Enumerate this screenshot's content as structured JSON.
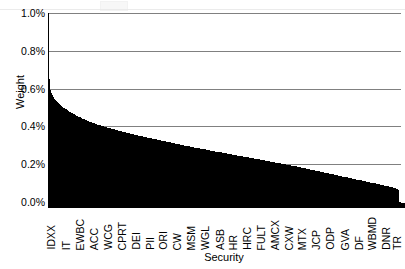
{
  "chart_data": {
    "type": "bar",
    "title": "",
    "xlabel": "Security",
    "ylabel": "Weight",
    "ylim": [
      0,
      1.0
    ],
    "y_unit": "%",
    "y_ticks": [
      "0.0%",
      "0.2%",
      "0.4%",
      "0.6%",
      "0.8%",
      "1.0%"
    ],
    "y_tick_values": [
      0.0,
      0.2,
      0.4,
      0.6,
      0.8,
      1.0
    ],
    "grid": true,
    "legend": "none",
    "bar_color": "#000000",
    "gridline_color": "#808080",
    "axis_color": "#000000",
    "n_bars": 400,
    "x_tick_labels": [
      "IDXX",
      "IT",
      "EWBC",
      "ACC",
      "WCG",
      "CPRT",
      "DEI",
      "PII",
      "ORI",
      "CW",
      "MSM",
      "WGL",
      "ASB",
      "HR",
      "HRC",
      "FULT",
      "AMCX",
      "CXW",
      "MTX",
      "JCP",
      "ODP",
      "GVA",
      "DF",
      "WBMD",
      "DNR",
      "TR"
    ],
    "x_tick_label_indices": [
      4,
      20,
      36,
      52,
      68,
      84,
      100,
      116,
      131,
      147,
      163,
      179,
      195,
      210,
      226,
      242,
      258,
      274,
      289,
      305,
      321,
      337,
      353,
      368,
      384,
      397
    ],
    "values": [
      0.652,
      0.593,
      0.575,
      0.566,
      0.558,
      0.551,
      0.545,
      0.539,
      0.534,
      0.529,
      0.524,
      0.52,
      0.515,
      0.511,
      0.507,
      0.504,
      0.5,
      0.497,
      0.493,
      0.49,
      0.487,
      0.484,
      0.481,
      0.478,
      0.475,
      0.472,
      0.47,
      0.467,
      0.464,
      0.462,
      0.459,
      0.457,
      0.455,
      0.452,
      0.45,
      0.448,
      0.446,
      0.443,
      0.441,
      0.439,
      0.437,
      0.435,
      0.433,
      0.431,
      0.429,
      0.428,
      0.426,
      0.424,
      0.422,
      0.42,
      0.419,
      0.417,
      0.415,
      0.414,
      0.412,
      0.41,
      0.409,
      0.407,
      0.406,
      0.404,
      0.403,
      0.401,
      0.4,
      0.398,
      0.397,
      0.396,
      0.394,
      0.393,
      0.391,
      0.39,
      0.389,
      0.387,
      0.386,
      0.385,
      0.384,
      0.382,
      0.381,
      0.38,
      0.379,
      0.377,
      0.376,
      0.375,
      0.374,
      0.373,
      0.371,
      0.37,
      0.369,
      0.368,
      0.367,
      0.366,
      0.364,
      0.363,
      0.362,
      0.361,
      0.36,
      0.359,
      0.358,
      0.357,
      0.356,
      0.354,
      0.353,
      0.352,
      0.351,
      0.35,
      0.349,
      0.348,
      0.347,
      0.346,
      0.345,
      0.344,
      0.343,
      0.342,
      0.341,
      0.34,
      0.339,
      0.338,
      0.337,
      0.336,
      0.335,
      0.334,
      0.333,
      0.332,
      0.331,
      0.33,
      0.329,
      0.328,
      0.327,
      0.326,
      0.325,
      0.324,
      0.323,
      0.322,
      0.321,
      0.32,
      0.319,
      0.318,
      0.317,
      0.316,
      0.315,
      0.314,
      0.313,
      0.312,
      0.311,
      0.31,
      0.309,
      0.308,
      0.307,
      0.306,
      0.305,
      0.304,
      0.303,
      0.302,
      0.301,
      0.3,
      0.299,
      0.298,
      0.298,
      0.297,
      0.296,
      0.295,
      0.294,
      0.293,
      0.292,
      0.291,
      0.29,
      0.289,
      0.288,
      0.287,
      0.287,
      0.286,
      0.285,
      0.284,
      0.283,
      0.282,
      0.281,
      0.28,
      0.279,
      0.279,
      0.278,
      0.277,
      0.276,
      0.275,
      0.274,
      0.273,
      0.272,
      0.272,
      0.271,
      0.27,
      0.269,
      0.268,
      0.267,
      0.266,
      0.266,
      0.265,
      0.264,
      0.263,
      0.262,
      0.261,
      0.26,
      0.26,
      0.259,
      0.258,
      0.257,
      0.256,
      0.255,
      0.254,
      0.254,
      0.253,
      0.252,
      0.251,
      0.25,
      0.249,
      0.248,
      0.248,
      0.247,
      0.246,
      0.245,
      0.244,
      0.243,
      0.243,
      0.242,
      0.241,
      0.24,
      0.239,
      0.238,
      0.237,
      0.237,
      0.236,
      0.235,
      0.234,
      0.233,
      0.232,
      0.232,
      0.231,
      0.23,
      0.229,
      0.228,
      0.227,
      0.226,
      0.226,
      0.225,
      0.224,
      0.223,
      0.222,
      0.221,
      0.22,
      0.22,
      0.219,
      0.218,
      0.217,
      0.216,
      0.215,
      0.214,
      0.214,
      0.213,
      0.212,
      0.211,
      0.21,
      0.209,
      0.208,
      0.207,
      0.207,
      0.206,
      0.205,
      0.204,
      0.203,
      0.202,
      0.201,
      0.2,
      0.199,
      0.199,
      0.198,
      0.197,
      0.196,
      0.195,
      0.194,
      0.193,
      0.192,
      0.191,
      0.19,
      0.189,
      0.188,
      0.188,
      0.187,
      0.186,
      0.185,
      0.184,
      0.183,
      0.182,
      0.181,
      0.18,
      0.179,
      0.178,
      0.177,
      0.176,
      0.175,
      0.174,
      0.173,
      0.172,
      0.171,
      0.17,
      0.169,
      0.168,
      0.167,
      0.166,
      0.165,
      0.164,
      0.163,
      0.162,
      0.161,
      0.16,
      0.159,
      0.158,
      0.157,
      0.156,
      0.155,
      0.154,
      0.153,
      0.152,
      0.151,
      0.15,
      0.149,
      0.148,
      0.147,
      0.146,
      0.145,
      0.144,
      0.143,
      0.142,
      0.141,
      0.14,
      0.139,
      0.138,
      0.137,
      0.136,
      0.135,
      0.134,
      0.133,
      0.132,
      0.131,
      0.13,
      0.129,
      0.128,
      0.127,
      0.126,
      0.125,
      0.124,
      0.123,
      0.122,
      0.121,
      0.12,
      0.119,
      0.118,
      0.117,
      0.116,
      0.115,
      0.114,
      0.113,
      0.112,
      0.111,
      0.11,
      0.109,
      0.108,
      0.107,
      0.106,
      0.105,
      0.104,
      0.103,
      0.102,
      0.101,
      0.1,
      0.099,
      0.098,
      0.097,
      0.096,
      0.095,
      0.094,
      0.093,
      0.092,
      0.091,
      0.09,
      0.089,
      0.088,
      0.087,
      0.086,
      0.085,
      0.084,
      0.083,
      0.082,
      0.081,
      0.08,
      0.079,
      0.078,
      0.076,
      0.075,
      0.073,
      0.071,
      0.069,
      0.067,
      0.062
    ]
  }
}
